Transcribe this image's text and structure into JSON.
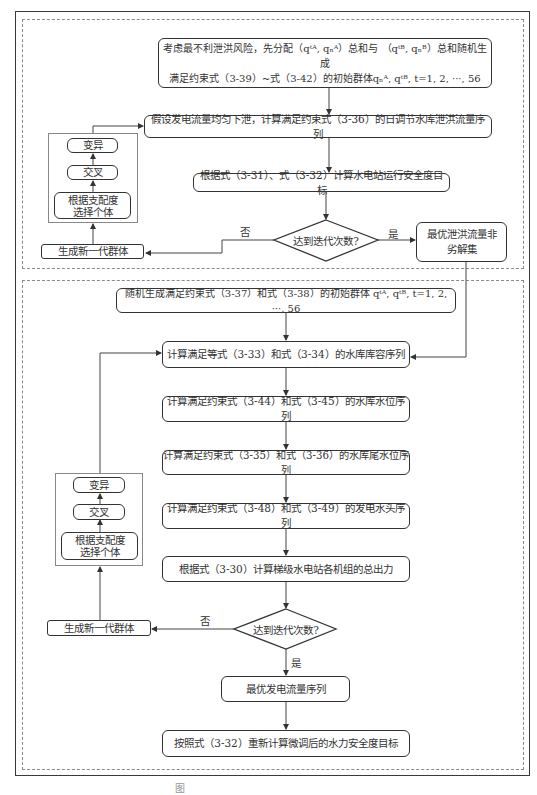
{
  "flowchart": {
    "upper_section": {
      "init_box": {
        "line1": "考虑最不利泄洪风险，先分配（qᵗᴬ, qₙᴬ）总和与 （qᵗᴮ, qₙᴮ）总和随机生成",
        "line2": "满足约束式（3-39）~式（3-42）的初始群体qₙᴬ, qᵗᴮ, t=1, 2, ···, 56"
      },
      "step_flood_sequence": "假设发电流量均匀下泄，计算满足约束式（3-36）的日调节水库泄洪流量序列",
      "step_safety_objective": "根据式（3-31）、式（3-32）计算水电站运行安全度目标",
      "decision": "达到迭代次数?",
      "no_label": "否",
      "yes_label": "是",
      "result_box": {
        "line1": "最优泄洪流量非",
        "line2": "劣解集"
      },
      "new_generation": "生成新一代群体",
      "ga_ops": {
        "mutation": "变异",
        "crossover": "交叉",
        "selection": {
          "line1": "根据支配度",
          "line2": "选择个体"
        }
      }
    },
    "lower_section": {
      "init_box": "随机生成满足约束式（3-37）和式（3-38）的初始群体 qᵗᴬ, qᵗᴮ, t=1, 2, ···, 56",
      "step_storage": "计算满足等式（3-33）和式（3-34）的水库库容序列",
      "step_water_level": "计算满足约束式（3-44）和式（3-45）的水库水位序列",
      "step_tail_level": "计算满足约束式（3-35）和式（3-36）的水库尾水位序列",
      "step_head": "计算满足约束式（3-48）和式（3-49）的发电水头序列",
      "step_output": "根据式（3-30）计算梯级水电站各机组的总出力",
      "decision": "达到迭代次数?",
      "no_label": "否",
      "yes_label": "是",
      "result_box": "最优发电流量序列",
      "final_box": "按照式（3-32）重新计算微调后的水力安全度目标",
      "new_generation": "生成新一代群体",
      "ga_ops": {
        "mutation": "变异",
        "crossover": "交叉",
        "selection": {
          "line1": "根据支配度",
          "line2": "选择个体"
        }
      }
    },
    "caption": "图"
  }
}
